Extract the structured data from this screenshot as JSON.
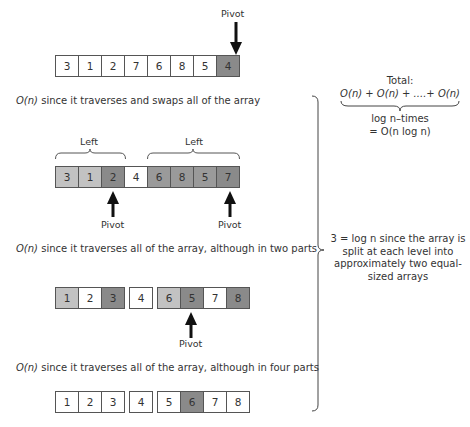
{
  "pivot_label": "Pivot",
  "level1": {
    "cells": [
      {
        "value": "3",
        "shade": "white"
      },
      {
        "value": "1",
        "shade": "white"
      },
      {
        "value": "2",
        "shade": "white"
      },
      {
        "value": "7",
        "shade": "white"
      },
      {
        "value": "6",
        "shade": "white"
      },
      {
        "value": "8",
        "shade": "white"
      },
      {
        "value": "5",
        "shade": "white"
      },
      {
        "value": "4",
        "shade": "dark"
      }
    ],
    "caption_prefix": "O(n)",
    "caption_text": " since it traverses and swaps all of the array"
  },
  "level2": {
    "left_label": "Left",
    "right_label": "Left",
    "cells": [
      "3",
      "1",
      "2",
      "4",
      "6",
      "8",
      "5",
      "7"
    ],
    "caption_prefix": "O(n)",
    "caption_text": " since it traverses all of the array, although in two parts"
  },
  "level3": {
    "cells": [
      "1",
      "2",
      "3",
      "4",
      "6",
      "5",
      "7",
      "8"
    ],
    "caption_prefix": "O(n)",
    "caption_text": " since it traverses all of the array, although in four parts"
  },
  "level4": {
    "cells": [
      "1",
      "2",
      "3",
      "4",
      "5",
      "6",
      "7",
      "8"
    ]
  },
  "total": {
    "heading": "Total:",
    "sum": "O(n) + O(n) + ....+ O(n)",
    "times": "log n–times",
    "result": "= O(n log n)"
  },
  "levels_note": {
    "line1": "3 = log n since the array is",
    "line2": "split at each level into",
    "line3": "approximately two equal-",
    "line4": "sized arrays"
  },
  "colors": {
    "white": "#ffffff",
    "light": "#c2c2c2",
    "mid": "#9a9a9a",
    "dark": "#8a8a8a",
    "border": "#555555"
  }
}
